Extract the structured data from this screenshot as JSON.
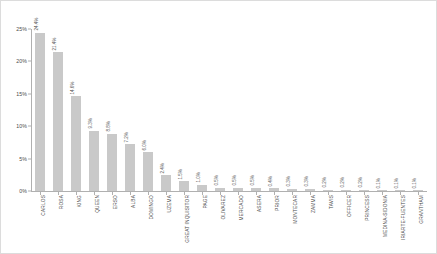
{
  "chart_data": {
    "type": "bar",
    "title": "",
    "subtitle": "",
    "xlabel": "",
    "ylabel": "",
    "ylim": [
      0,
      25
    ],
    "grid": false,
    "legend": "none",
    "y_tick_labels": [
      "0%",
      "5%",
      "10%",
      "15%",
      "20%",
      "25%"
    ],
    "y_tick_values": [
      0,
      5,
      10,
      15,
      20,
      25
    ],
    "categories": [
      "CARLOS",
      "ROSA",
      "KING",
      "QUEEN",
      "ERSO",
      "ALBA",
      "DOMINGO",
      "UZEMA",
      "GREAT INQUISITOR",
      "PAGE",
      "OLIVAREZ",
      "MERCADO",
      "ASERA",
      "PRIOR",
      "MONTECAR",
      "ZAMMA",
      "TAVIS",
      "OFFICER",
      "PRINCESS",
      "MEDINA-SIDONIA",
      "IRIARTE-FUENTES",
      "GRANTHAM"
    ],
    "values": [
      24.4,
      21.4,
      14.6,
      9.3,
      8.8,
      7.2,
      6.0,
      2.4,
      1.5,
      1.0,
      0.5,
      0.5,
      0.5,
      0.4,
      0.3,
      0.3,
      0.2,
      0.2,
      0.2,
      0.1,
      0.1,
      0.1
    ],
    "value_labels": [
      "24.4%",
      "21.4%",
      "14.6%",
      "9.3%",
      "8.8%",
      "7.2%",
      "6.0%",
      "2.4%",
      "1.5%",
      "1.0%",
      "0.5%",
      "0.5%",
      "0.5%",
      "0.4%",
      "0.3%",
      "0.3%",
      "0.2%",
      "0.2%",
      "0.2%",
      "0.1%",
      "0.1%",
      "0.1%"
    ],
    "bar_color": "#c9c9c9",
    "axis_color": "#b0b0b0",
    "text_color": "#4a4a4a",
    "background": "#ffffff"
  }
}
